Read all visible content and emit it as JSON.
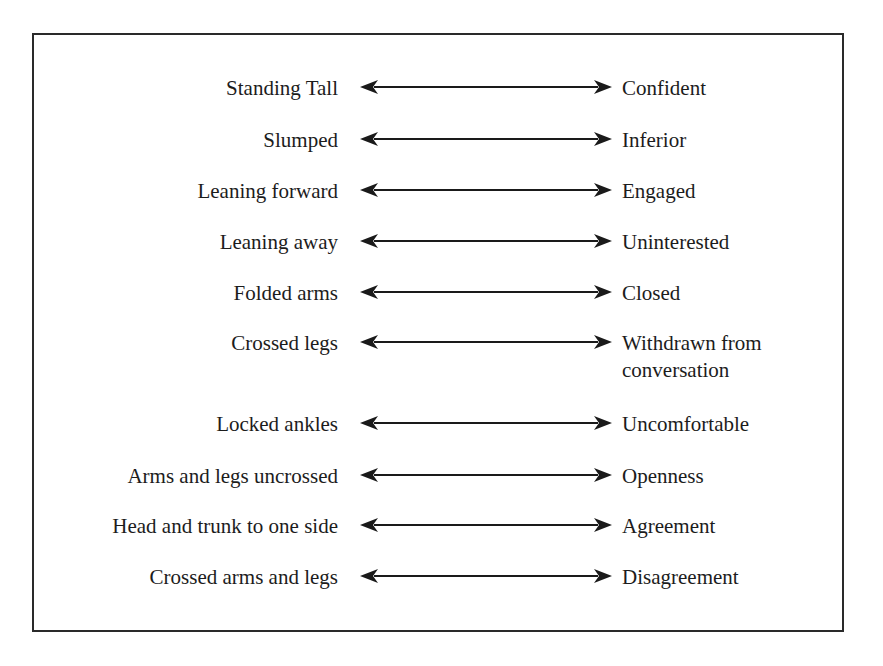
{
  "diagram": {
    "type": "mapping",
    "rows": [
      {
        "posture": "Standing Tall",
        "meaning": "Confident"
      },
      {
        "posture": "Slumped",
        "meaning": "Inferior"
      },
      {
        "posture": "Leaning forward",
        "meaning": "Engaged"
      },
      {
        "posture": "Leaning away",
        "meaning": "Uninterested"
      },
      {
        "posture": "Folded arms",
        "meaning": "Closed"
      },
      {
        "posture": "Crossed legs",
        "meaning": "Withdrawn from\nconversation"
      },
      {
        "posture": "Locked ankles",
        "meaning": "Uncomfortable"
      },
      {
        "posture": "Arms and legs uncrossed",
        "meaning": "Openness"
      },
      {
        "posture": "Head and trunk to one side",
        "meaning": "Agreement"
      },
      {
        "posture": "Crossed arms and legs",
        "meaning": "Disagreement"
      }
    ],
    "connector_icon": "double-headed-arrow",
    "colors": {
      "text": "#1c1c1c",
      "border": "#2a2a2a",
      "arrow": "#1a1a1a"
    }
  }
}
